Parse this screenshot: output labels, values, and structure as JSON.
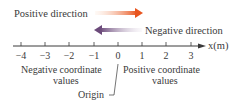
{
  "labels": {
    "positive_direction": "Positive direction",
    "negative_direction": "Negative direction",
    "axis_label": "x(m)",
    "negative_values_line1": "Negative coordinate",
    "negative_values_line2": "values",
    "positive_values_line1": "Positive coordinate",
    "positive_values_line2": "values",
    "origin": "Origin"
  },
  "ticks": [
    {
      "label": "−4",
      "x": 21
    },
    {
      "label": "−3",
      "x": 45
    },
    {
      "label": "−2",
      "x": 69
    },
    {
      "label": "−1",
      "x": 94
    },
    {
      "label": "0",
      "x": 118
    },
    {
      "label": "1",
      "x": 142
    },
    {
      "label": "2",
      "x": 166
    },
    {
      "label": "3",
      "x": 191
    }
  ],
  "colors": {
    "positive_arrow": "#e8541e",
    "negative_arrow": "#6b4a7a",
    "axis": "#3a3a3a"
  }
}
